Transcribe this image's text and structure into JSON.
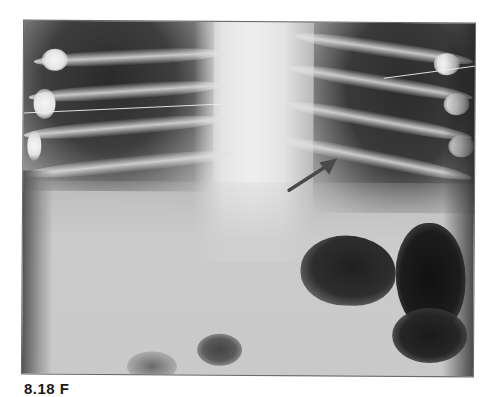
{
  "figure": {
    "type": "radiograph",
    "annotation": {
      "icon": "arrow-icon",
      "direction": "up-right",
      "color": "#4a4a4a"
    },
    "caption": {
      "label": "8.18 F",
      "truncated": true
    }
  }
}
